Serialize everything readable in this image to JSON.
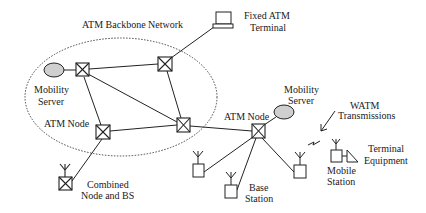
{
  "diagram": {
    "title": "ATM Backbone Network",
    "colors": {
      "stroke": "#222222",
      "server_fill": "#cfcfcf",
      "background": "#ffffff"
    },
    "backbone": {
      "cx": 121,
      "cy": 97,
      "rx": 96,
      "ry": 59,
      "label": "ATM Backbone Network"
    },
    "labels": {
      "backbone": "ATM Backbone Network",
      "fixed_terminal_l1": "Fixed ATM",
      "fixed_terminal_l2": "Terminal",
      "mobility_server_left_l1": "Mobility",
      "mobility_server_left_l2": "Server",
      "atm_node_left": "ATM Node",
      "atm_node_right": "ATM Node",
      "mobility_server_right_l1": "Mobility",
      "mobility_server_right_l2": "Server",
      "watm_l1": "WATM",
      "watm_l2": "Transmissions",
      "terminal_equipment_l1": "Terminal",
      "terminal_equipment_l2": "Equipment",
      "mobile_station_l1": "Mobile",
      "mobile_station_l2": "Station",
      "base_station_l1": "Base",
      "base_station_l2": "Station",
      "combined_l1": "Combined",
      "combined_l2": "Node and BS"
    },
    "nodes": [
      {
        "id": "backbone-node-1",
        "type": "atm-switch",
        "x": 82,
        "y": 70
      },
      {
        "id": "backbone-node-2",
        "type": "atm-switch",
        "x": 165,
        "y": 64
      },
      {
        "id": "backbone-node-3",
        "type": "atm-switch",
        "x": 103,
        "y": 132
      },
      {
        "id": "backbone-node-4",
        "type": "atm-switch",
        "x": 183,
        "y": 125
      },
      {
        "id": "atm-node-right",
        "type": "atm-switch",
        "x": 258,
        "y": 131
      },
      {
        "id": "combined-node-bs",
        "type": "atm-switch-with-antenna",
        "x": 65,
        "y": 183
      },
      {
        "id": "base-station-1",
        "type": "base-station",
        "x": 198,
        "y": 170
      },
      {
        "id": "base-station-2",
        "type": "base-station",
        "x": 231,
        "y": 191
      },
      {
        "id": "base-station-3",
        "type": "base-station",
        "x": 300,
        "y": 171
      },
      {
        "id": "mobility-server-left",
        "type": "server",
        "x": 54,
        "y": 70
      },
      {
        "id": "mobility-server-right",
        "type": "server",
        "x": 282,
        "y": 113
      },
      {
        "id": "fixed-atm-terminal",
        "type": "terminal",
        "x": 223,
        "y": 20
      },
      {
        "id": "mobile-station",
        "type": "mobile-station",
        "x": 336,
        "y": 156
      }
    ],
    "links": [
      [
        "mobility-server-left",
        "backbone-node-1"
      ],
      [
        "backbone-node-1",
        "backbone-node-2"
      ],
      [
        "backbone-node-1",
        "backbone-node-3"
      ],
      [
        "backbone-node-1",
        "backbone-node-4"
      ],
      [
        "backbone-node-2",
        "backbone-node-4"
      ],
      [
        "backbone-node-2",
        "fixed-atm-terminal"
      ],
      [
        "backbone-node-3",
        "backbone-node-4"
      ],
      [
        "backbone-node-3",
        "combined-node-bs"
      ],
      [
        "backbone-node-4",
        "atm-node-right"
      ],
      [
        "atm-node-right",
        "mobility-server-right"
      ],
      [
        "atm-node-right",
        "base-station-1"
      ],
      [
        "atm-node-right",
        "base-station-2"
      ],
      [
        "atm-node-right",
        "base-station-3"
      ]
    ]
  }
}
